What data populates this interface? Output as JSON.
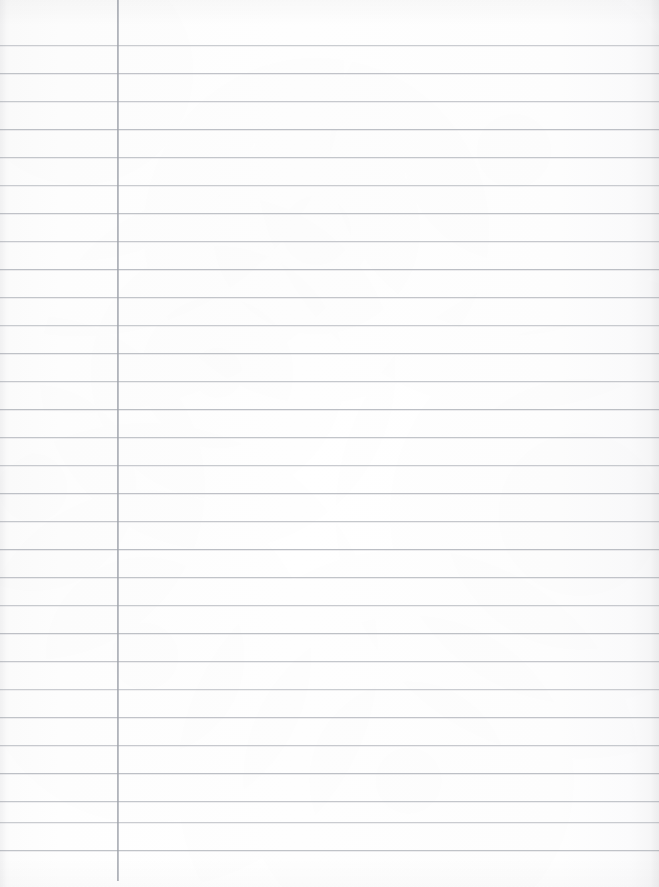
{
  "document": {
    "kind": "ruled-notebook-paper",
    "title": "Blank lined notebook page",
    "orientation": "portrait",
    "width_px": 659,
    "height_px": 887,
    "content_text": "",
    "is_blank": true
  },
  "paper": {
    "background_color": "#fdfdfd",
    "surface_tint": "#fbfbfc",
    "edge_shadow_color": "#e9eaec"
  },
  "ruling": {
    "style": "wide-ruled",
    "line_color": "#b9bcc2",
    "line_thickness_px": 1,
    "first_line_y": 45,
    "line_spacing_px": 28,
    "line_count": 30,
    "line_left_x": 0,
    "line_right_x": 659,
    "lines_y": [
      45,
      73,
      101,
      129,
      157,
      185,
      213,
      241,
      269,
      297,
      325,
      353,
      381,
      409,
      437,
      465,
      493,
      521,
      549,
      577,
      605,
      633,
      661,
      689,
      717,
      745,
      773,
      801,
      822,
      850
    ]
  },
  "margin_rule": {
    "color": "#969aa3",
    "thickness_px": 2,
    "x": 117,
    "top_y": 0,
    "bottom_y": 881,
    "label": "left-margin-rule"
  },
  "regions": {
    "margin_column_label": "margin column",
    "writing_area_label": "writing area",
    "header_area_label": "header area above first rule"
  }
}
